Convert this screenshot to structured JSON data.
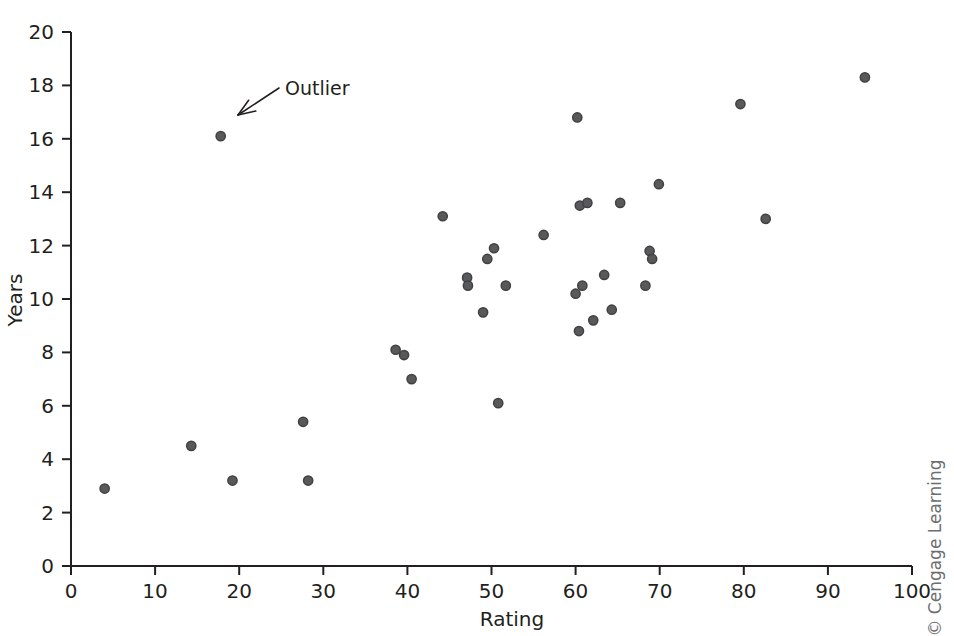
{
  "chart_data": {
    "type": "scatter",
    "title": "",
    "xlabel": "Rating",
    "ylabel": "Years",
    "xlim": [
      0,
      100
    ],
    "ylim": [
      0,
      20
    ],
    "xticks": [
      0,
      10,
      20,
      30,
      40,
      50,
      60,
      70,
      80,
      90,
      100
    ],
    "yticks": [
      0,
      2,
      4,
      6,
      8,
      10,
      12,
      14,
      16,
      18,
      20
    ],
    "xtick_labels": [
      "0",
      "10",
      "20",
      "30",
      "40",
      "50",
      "60",
      "70",
      "80",
      "90",
      "100"
    ],
    "ytick_labels": [
      "0",
      "2",
      "4",
      "6",
      "8",
      "10",
      "12",
      "14",
      "16",
      "18",
      "20"
    ],
    "grid": false,
    "legend": null,
    "marker_color": "#58595b",
    "marker_edge_color": "#414042",
    "axis_color": "#231f20",
    "points": [
      {
        "x": 4.0,
        "y": 2.9
      },
      {
        "x": 14.3,
        "y": 4.5
      },
      {
        "x": 19.2,
        "y": 3.2
      },
      {
        "x": 17.8,
        "y": 16.1
      },
      {
        "x": 27.6,
        "y": 5.4
      },
      {
        "x": 28.2,
        "y": 3.2
      },
      {
        "x": 38.6,
        "y": 8.1
      },
      {
        "x": 39.6,
        "y": 7.9
      },
      {
        "x": 40.5,
        "y": 7.0
      },
      {
        "x": 44.2,
        "y": 13.1
      },
      {
        "x": 47.1,
        "y": 10.8
      },
      {
        "x": 47.2,
        "y": 10.5
      },
      {
        "x": 49.0,
        "y": 9.5
      },
      {
        "x": 49.5,
        "y": 11.5
      },
      {
        "x": 50.3,
        "y": 11.9
      },
      {
        "x": 50.8,
        "y": 6.1
      },
      {
        "x": 51.7,
        "y": 10.5
      },
      {
        "x": 56.2,
        "y": 12.4
      },
      {
        "x": 60.0,
        "y": 10.2
      },
      {
        "x": 60.2,
        "y": 16.8
      },
      {
        "x": 60.4,
        "y": 8.8
      },
      {
        "x": 60.8,
        "y": 10.5
      },
      {
        "x": 60.5,
        "y": 13.5
      },
      {
        "x": 61.4,
        "y": 13.6
      },
      {
        "x": 62.1,
        "y": 9.2
      },
      {
        "x": 63.4,
        "y": 10.9
      },
      {
        "x": 64.3,
        "y": 9.6
      },
      {
        "x": 65.3,
        "y": 13.6
      },
      {
        "x": 68.3,
        "y": 10.5
      },
      {
        "x": 68.8,
        "y": 11.8
      },
      {
        "x": 69.1,
        "y": 11.5
      },
      {
        "x": 69.9,
        "y": 14.3
      },
      {
        "x": 79.6,
        "y": 17.3
      },
      {
        "x": 82.6,
        "y": 13.0
      },
      {
        "x": 94.4,
        "y": 18.3
      }
    ],
    "annotations": [
      {
        "text": "Outlier",
        "label_x": 285,
        "label_y": 95,
        "arrow_tail_x": 279,
        "arrow_tail_y": 88,
        "arrow_tip_x": 238,
        "arrow_tip_y": 115
      }
    ]
  },
  "watermark": {
    "text": "© Cengage Learning"
  }
}
